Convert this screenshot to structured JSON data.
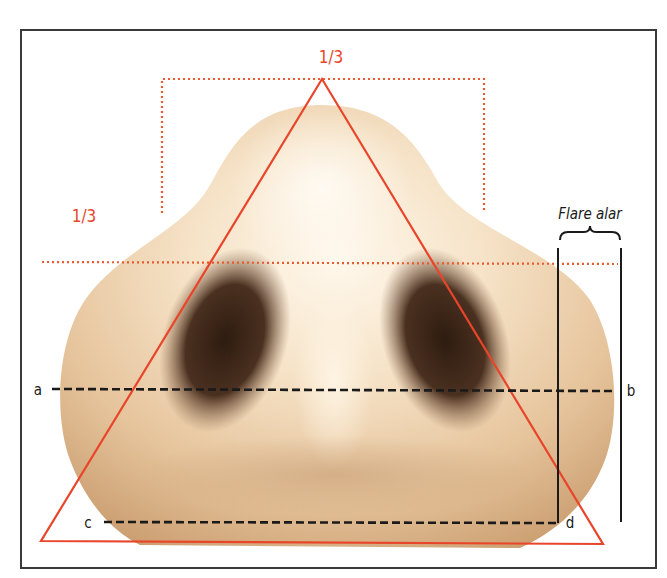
{
  "figure": {
    "labels": {
      "top_fraction": "1/3",
      "left_fraction": "1/3",
      "flare": "Flare alar",
      "point_a": "a",
      "point_b": "b",
      "point_c": "c",
      "point_d": "d"
    },
    "colors": {
      "accent_orange": "#e8452a",
      "dotted_orange": "#e85a30",
      "dashed_black": "#1a1a1a",
      "frame": "#3a3a3a",
      "skin_light": "#fdf2e2",
      "skin_mid": "#e9c9a0",
      "skin_dark": "#c89a6c",
      "nostril": "#3a2616"
    }
  }
}
